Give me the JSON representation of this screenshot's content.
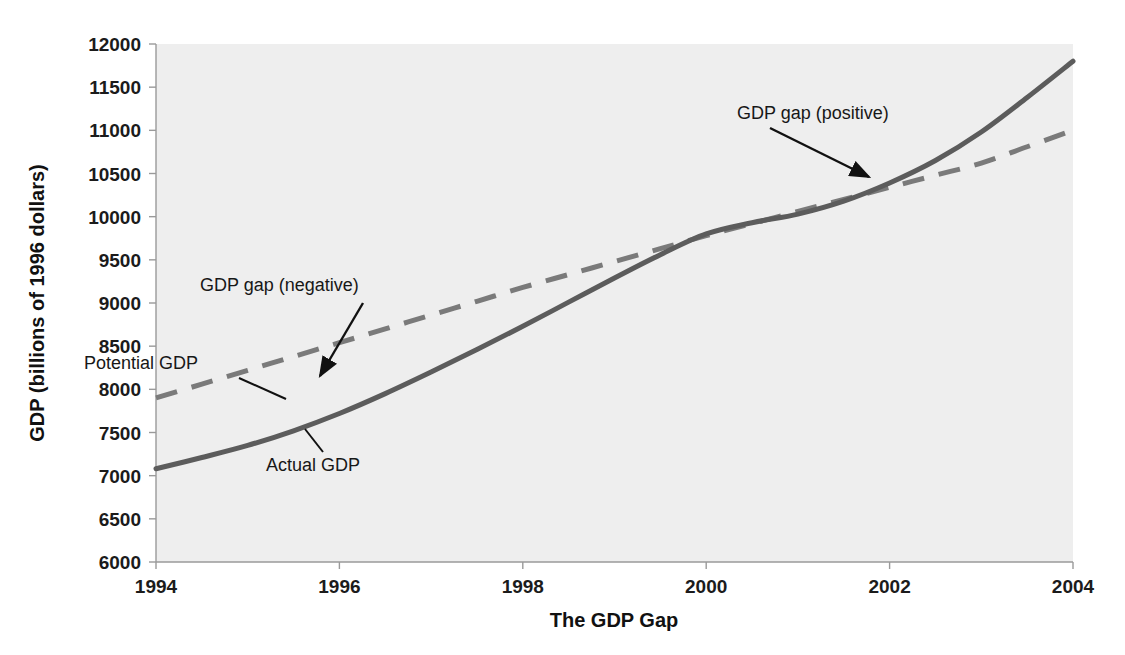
{
  "chart_data": {
    "type": "line",
    "title": "",
    "xlabel": "The GDP Gap",
    "ylabel": "GDP (billions of 1996 dollars)",
    "xlim": [
      1994,
      2004
    ],
    "ylim": [
      6000,
      12000
    ],
    "xticks": [
      "1994",
      "1996",
      "1998",
      "2000",
      "2002",
      "2004"
    ],
    "yticks": [
      "12000",
      "11500",
      "11000",
      "10500",
      "10000",
      "9500",
      "9000",
      "8500",
      "8000",
      "7500",
      "7000",
      "6500",
      "6000"
    ],
    "grid": false,
    "legend": "none (inline annotations)",
    "x": [
      1994,
      1994.5,
      1995,
      1995.5,
      1996,
      1996.5,
      1997,
      1997.5,
      1998,
      1998.5,
      1999,
      1999.5,
      2000,
      2000.5,
      2001,
      2001.5,
      2002,
      2002.5,
      2003,
      2003.5,
      2004
    ],
    "series": [
      {
        "name": "Actual GDP",
        "style": "solid",
        "color": "#5c5c5c",
        "values": [
          7080,
          7210,
          7350,
          7520,
          7720,
          7950,
          8200,
          8460,
          8730,
          9010,
          9290,
          9560,
          9800,
          9930,
          10030,
          10180,
          10390,
          10650,
          10980,
          11380,
          11800
        ]
      },
      {
        "name": "Potential GDP",
        "style": "dashed",
        "color": "#7a7a7a",
        "values": [
          7900,
          8060,
          8220,
          8380,
          8540,
          8700,
          8860,
          9020,
          9180,
          9330,
          9480,
          9630,
          9780,
          9920,
          10060,
          10200,
          10340,
          10480,
          10620,
          10810,
          11000
        ]
      }
    ],
    "annotations": [
      {
        "id": "potential-gdp",
        "text": "Potential GDP",
        "anchor_year": 1995.1,
        "anchor_value": 8160
      },
      {
        "id": "actual-gdp",
        "text": "Actual GDP",
        "anchor_year": 1995.6,
        "anchor_value": 7460
      },
      {
        "id": "gdp-gap-negative",
        "text": "GDP gap (negative)",
        "anchor_year": 1995.7,
        "anchor_value": 8150
      },
      {
        "id": "gdp-gap-positive",
        "text": "GDP gap (positive)",
        "anchor_year": 2002.6,
        "anchor_value": 10720
      }
    ]
  },
  "figure": {
    "plot_background": "#eeeeee",
    "axis_color": "#9a9a9a",
    "text_color": "#1b1b1b"
  }
}
